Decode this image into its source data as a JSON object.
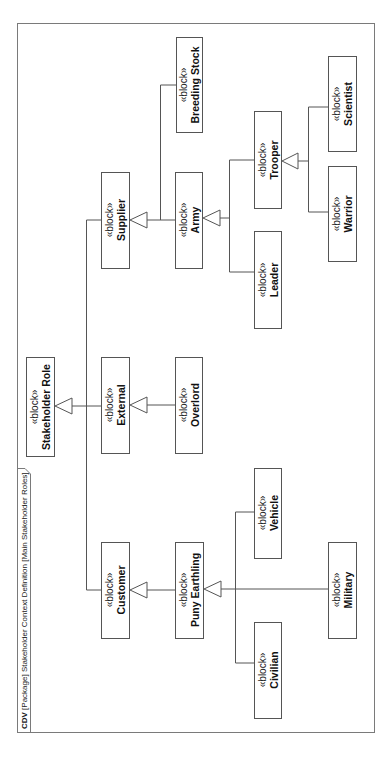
{
  "diagram": {
    "header": {
      "kind": "CDV",
      "rest": " [Package] Stakeholder Context Definition [Main Stakeholder Roles]"
    },
    "stereotype": "«block»",
    "blocks": [
      {
        "id": "stakeholder_role",
        "name": "Stakeholder Role"
      },
      {
        "id": "supplier",
        "name": "Supplier"
      },
      {
        "id": "external",
        "name": "External"
      },
      {
        "id": "customer",
        "name": "Customer"
      },
      {
        "id": "breeding_stock",
        "name": "Breeding Stock"
      },
      {
        "id": "army",
        "name": "Army"
      },
      {
        "id": "overlord",
        "name": "Overlord"
      },
      {
        "id": "puny_earthling",
        "name": "Puny Earthling"
      },
      {
        "id": "trooper",
        "name": "Trooper"
      },
      {
        "id": "leader",
        "name": "Leader"
      },
      {
        "id": "vehicle",
        "name": "Vehicle"
      },
      {
        "id": "civilian",
        "name": "Civilian"
      },
      {
        "id": "scientist",
        "name": "Scientist"
      },
      {
        "id": "warrior",
        "name": "Warrior"
      },
      {
        "id": "military",
        "name": "Military"
      }
    ],
    "generalizations": [
      {
        "child": "Supplier",
        "parent": "Stakeholder Role"
      },
      {
        "child": "External",
        "parent": "Stakeholder Role"
      },
      {
        "child": "Customer",
        "parent": "Stakeholder Role"
      },
      {
        "child": "Breeding Stock",
        "parent": "Supplier"
      },
      {
        "child": "Army",
        "parent": "Supplier"
      },
      {
        "child": "Overlord",
        "parent": "External"
      },
      {
        "child": "Puny Earthling",
        "parent": "Customer"
      },
      {
        "child": "Trooper",
        "parent": "Army"
      },
      {
        "child": "Leader",
        "parent": "Army"
      },
      {
        "child": "Scientist",
        "parent": "Trooper"
      },
      {
        "child": "Warrior",
        "parent": "Trooper"
      },
      {
        "child": "Vehicle",
        "parent": "Puny Earthling"
      },
      {
        "child": "Military",
        "parent": "Puny Earthling"
      },
      {
        "child": "Civilian",
        "parent": "Puny Earthling"
      }
    ],
    "orientation": "rotated 90° counter-clockwise"
  }
}
